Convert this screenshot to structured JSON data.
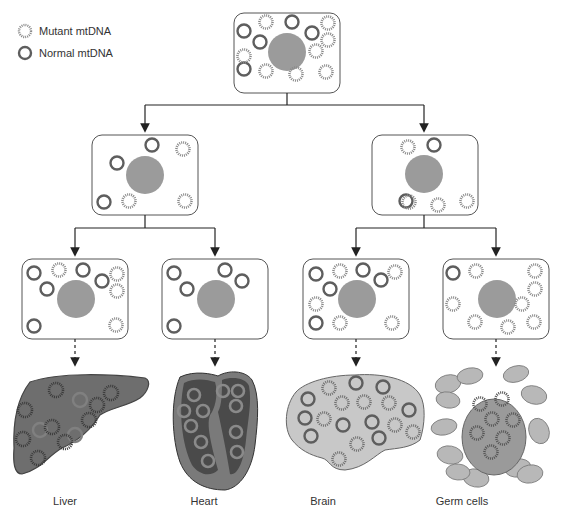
{
  "legend": {
    "mutant_label": "Mutant mtDNA",
    "normal_label": "Normal mtDNA"
  },
  "colors": {
    "normal_ring": "#5e5e5e",
    "mutant_ring": "#8a8a8a",
    "nucleus": "#9b9b9b",
    "cell_border": "#555555",
    "liver_fill": "#6e6e6e",
    "heart_outer": "#7a7a7a",
    "heart_inner": "#4a4a4a",
    "brain_fill": "#c8c8c8",
    "germ_fill": "#9a9a9a",
    "germ_surround": "#b8b8b8"
  },
  "cells": [
    {
      "id": "top",
      "x": 234,
      "y": 13,
      "w": 106,
      "h": 80,
      "nucleus": [
        287,
        52,
        19
      ],
      "normal": [
        [
          244,
          31
        ],
        [
          260,
          42
        ],
        [
          292,
          22
        ],
        [
          312,
          33
        ],
        [
          244,
          69
        ]
      ],
      "mutant": [
        [
          266,
          22
        ],
        [
          328,
          23
        ],
        [
          328,
          40
        ],
        [
          244,
          56
        ],
        [
          316,
          51
        ],
        [
          266,
          71
        ],
        [
          296,
          74
        ],
        [
          326,
          72
        ]
      ]
    },
    {
      "id": "gen2-left",
      "x": 92,
      "y": 135,
      "w": 106,
      "h": 80,
      "nucleus": [
        145,
        175,
        19
      ],
      "normal": [
        [
          152,
          145
        ],
        [
          117,
          163
        ],
        [
          104,
          202
        ]
      ],
      "mutant": [
        [
          183,
          149
        ],
        [
          129,
          201
        ],
        [
          185,
          201
        ]
      ]
    },
    {
      "id": "gen2-right",
      "x": 372,
      "y": 135,
      "w": 106,
      "h": 80,
      "nucleus": [
        424,
        174,
        19
      ],
      "normal": [
        [
          434,
          145
        ],
        [
          406,
          201
        ]
      ],
      "mutant": [
        [
          408,
          147
        ],
        [
          409,
          202
        ],
        [
          438,
          205
        ],
        [
          467,
          201
        ]
      ]
    },
    {
      "id": "gen3-1",
      "x": 22,
      "y": 259,
      "w": 106,
      "h": 80,
      "nucleus": [
        76,
        299,
        19
      ],
      "normal": [
        [
          34,
          273
        ],
        [
          47,
          289
        ],
        [
          83,
          270
        ],
        [
          102,
          281
        ],
        [
          34,
          326
        ]
      ],
      "mutant": [
        [
          59,
          270
        ],
        [
          117,
          274
        ],
        [
          117,
          291
        ],
        [
          116,
          325
        ]
      ]
    },
    {
      "id": "gen3-2",
      "x": 162,
      "y": 259,
      "w": 106,
      "h": 80,
      "nucleus": [
        216,
        299,
        19
      ],
      "normal": [
        [
          174,
          273
        ],
        [
          187,
          289
        ],
        [
          225,
          270
        ],
        [
          242,
          281
        ],
        [
          174,
          326
        ]
      ],
      "mutant": []
    },
    {
      "id": "gen3-3",
      "x": 303,
      "y": 259,
      "w": 106,
      "h": 80,
      "nucleus": [
        357,
        299,
        19
      ],
      "normal": [
        [
          316,
          274
        ],
        [
          330,
          289
        ],
        [
          363,
          270
        ],
        [
          381,
          280
        ],
        [
          316,
          323
        ]
      ],
      "mutant": [
        [
          340,
          271
        ],
        [
          395,
          272
        ],
        [
          316,
          304
        ],
        [
          340,
          323
        ],
        [
          392,
          323
        ]
      ]
    },
    {
      "id": "gen3-4",
      "x": 443,
      "y": 259,
      "w": 106,
      "h": 80,
      "nucleus": [
        497,
        299,
        19
      ],
      "normal": [
        [
          453,
          273
        ]
      ],
      "mutant": [
        [
          476,
          271
        ],
        [
          535,
          271
        ],
        [
          535,
          289
        ],
        [
          453,
          304
        ],
        [
          522,
          304
        ],
        [
          475,
          322
        ],
        [
          508,
          327
        ],
        [
          534,
          322
        ]
      ]
    }
  ],
  "arrows": {
    "solid": [
      {
        "from": [
          287,
          93
        ],
        "to_y": 105,
        "branches": [
          145,
          424
        ],
        "end_y": 128
      },
      {
        "from": [
          145,
          215
        ],
        "to_y": 228,
        "branches": [
          75,
          215
        ],
        "end_y": 252
      },
      {
        "from": [
          424,
          215
        ],
        "to_y": 228,
        "branches": [
          356,
          496
        ],
        "end_y": 252
      }
    ],
    "dashed": [
      {
        "x": 75,
        "y1": 339,
        "y2": 362
      },
      {
        "x": 215,
        "y1": 339,
        "y2": 362
      },
      {
        "x": 356,
        "y1": 339,
        "y2": 362
      },
      {
        "x": 496,
        "y1": 339,
        "y2": 362
      }
    ]
  },
  "organs": [
    {
      "name": "Liver",
      "label_x": 65,
      "label_y": 495
    },
    {
      "name": "Heart",
      "label_x": 204,
      "label_y": 495
    },
    {
      "name": "Brain",
      "label_x": 323,
      "label_y": 495
    },
    {
      "name": "Germ cells",
      "label_x": 462,
      "label_y": 495
    }
  ],
  "liver_mito": {
    "mutant": [
      [
        56,
        390
      ],
      [
        111,
        393
      ],
      [
        25,
        410
      ],
      [
        97,
        405
      ],
      [
        52,
        427
      ],
      [
        89,
        420
      ],
      [
        23,
        439
      ],
      [
        65,
        442
      ],
      [
        38,
        458
      ]
    ],
    "normal_faint": [
      [
        80,
        400
      ],
      [
        40,
        430
      ],
      [
        75,
        435
      ]
    ]
  },
  "heart_mito": [
    [
      194,
      395
    ],
    [
      184,
      411
    ],
    [
      203,
      411
    ],
    [
      191,
      426
    ],
    [
      201,
      442
    ],
    [
      208,
      461
    ],
    [
      223,
      391
    ],
    [
      238,
      391
    ],
    [
      236,
      406
    ],
    [
      236,
      432
    ],
    [
      237,
      452
    ]
  ],
  "brain_mito": {
    "normal": [
      [
        356,
        383
      ],
      [
        383,
        387
      ],
      [
        308,
        399
      ],
      [
        305,
        418
      ],
      [
        372,
        422
      ],
      [
        409,
        410
      ],
      [
        343,
        425
      ],
      [
        311,
        436
      ],
      [
        379,
        438
      ]
    ],
    "mutant": [
      [
        329,
        388
      ],
      [
        342,
        403
      ],
      [
        364,
        402
      ],
      [
        389,
        403
      ],
      [
        324,
        419
      ],
      [
        395,
        425
      ],
      [
        413,
        432
      ],
      [
        357,
        444
      ],
      [
        339,
        459
      ]
    ]
  },
  "germ": {
    "center": [
      494,
      437
    ],
    "rx": 32,
    "ry": 38,
    "mito": [
      [
        480,
        404
      ],
      [
        502,
        399
      ],
      [
        492,
        419
      ],
      [
        513,
        420
      ],
      [
        477,
        433
      ],
      [
        503,
        438
      ],
      [
        491,
        452
      ]
    ],
    "surround": [
      [
        448,
        384,
        13,
        9,
        -15
      ],
      [
        470,
        376,
        13,
        8,
        -10
      ],
      [
        516,
        374,
        13,
        8,
        -15
      ],
      [
        448,
        400,
        12,
        8,
        10
      ],
      [
        534,
        395,
        13,
        9,
        15
      ],
      [
        444,
        427,
        13,
        8,
        -10
      ],
      [
        539,
        431,
        10,
        13,
        -20
      ],
      [
        450,
        455,
        13,
        9,
        10
      ],
      [
        476,
        478,
        13,
        9,
        10
      ],
      [
        518,
        468,
        13,
        9,
        -10
      ],
      [
        530,
        474,
        13,
        9,
        -10
      ],
      [
        458,
        472,
        12,
        8,
        5
      ]
    ]
  }
}
